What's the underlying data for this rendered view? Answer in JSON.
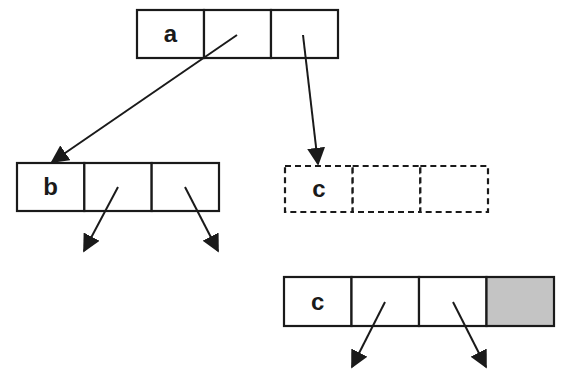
{
  "diagram": {
    "colors": {
      "stroke": "#1a1a1a",
      "background": "#ffffff",
      "shaded_cell": "#c4c4c4"
    },
    "nodes": [
      {
        "id": "a",
        "label": "a",
        "style": "solid",
        "x": 137,
        "y": 10,
        "width": 201,
        "height": 48,
        "cells": 3,
        "shaded_cells": []
      },
      {
        "id": "b",
        "label": "b",
        "style": "solid",
        "x": 17,
        "y": 163,
        "width": 202,
        "height": 48,
        "cells": 3,
        "shaded_cells": []
      },
      {
        "id": "c-dashed",
        "label": "c",
        "style": "dashed",
        "x": 285,
        "y": 166,
        "width": 203,
        "height": 46,
        "cells": 3,
        "shaded_cells": []
      },
      {
        "id": "c-solid",
        "label": "c",
        "style": "solid",
        "x": 284,
        "y": 277,
        "width": 270,
        "height": 49,
        "cells": 4,
        "shaded_cells": [
          3
        ]
      }
    ],
    "arrows": [
      {
        "from": "a.cell1",
        "to": "b",
        "x1": 237,
        "y1": 35,
        "x2": 52,
        "y2": 162
      },
      {
        "from": "a.cell2",
        "to": "c-dashed",
        "x1": 303,
        "y1": 35,
        "x2": 318,
        "y2": 164
      },
      {
        "from": "b.cell1",
        "to": "",
        "x1": 118,
        "y1": 187,
        "x2": 84,
        "y2": 251
      },
      {
        "from": "b.cell2",
        "to": "",
        "x1": 185,
        "y1": 187,
        "x2": 218,
        "y2": 251
      },
      {
        "from": "c-solid.cell1",
        "to": "",
        "x1": 385,
        "y1": 302,
        "x2": 352,
        "y2": 367
      },
      {
        "from": "c-solid.cell2",
        "to": "",
        "x1": 453,
        "y1": 302,
        "x2": 486,
        "y2": 367
      }
    ]
  }
}
